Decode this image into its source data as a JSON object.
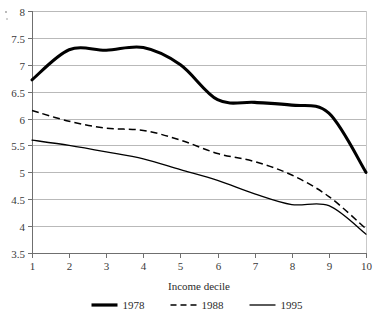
{
  "chart_data": {
    "type": "line",
    "title": "",
    "xlabel": "Income decile",
    "ylabel": "",
    "x": [
      1,
      2,
      3,
      4,
      5,
      6,
      7,
      8,
      9,
      10
    ],
    "categories": [
      "1",
      "2",
      "3",
      "4",
      "5",
      "6",
      "7",
      "8",
      "9",
      "10"
    ],
    "xlim": [
      1,
      10
    ],
    "ylim": [
      3.5,
      8
    ],
    "y_ticks": [
      3.5,
      4,
      4.5,
      5,
      5.5,
      6,
      6.5,
      7,
      7.5,
      8
    ],
    "y_tick_labels": [
      "3.5",
      "4",
      "4.5",
      "5",
      "5.5",
      "6",
      "6.5",
      "7",
      "7.5",
      "8"
    ],
    "x_ticks": [
      1,
      2,
      3,
      4,
      5,
      6,
      7,
      8,
      9,
      10
    ],
    "x_tick_labels": [
      "1",
      "2",
      "3",
      "4",
      "5",
      "6",
      "7",
      "8",
      "9",
      "10"
    ],
    "grid": "horizontal",
    "legend_position": "bottom",
    "series": [
      {
        "name": "1978",
        "style": "thick-solid",
        "color": "#000000",
        "values": [
          6.72,
          7.28,
          7.27,
          7.32,
          7.0,
          6.35,
          6.3,
          6.25,
          6.1,
          5.0
        ]
      },
      {
        "name": "1988",
        "style": "dashed",
        "color": "#000000",
        "values": [
          6.15,
          5.95,
          5.82,
          5.78,
          5.6,
          5.35,
          5.2,
          4.95,
          4.55,
          3.95
        ]
      },
      {
        "name": "1995",
        "style": "thin-solid",
        "color": "#000000",
        "values": [
          5.6,
          5.5,
          5.38,
          5.25,
          5.05,
          4.85,
          4.6,
          4.4,
          4.38,
          3.85
        ]
      }
    ]
  },
  "legend": {
    "items": [
      {
        "label": "1978"
      },
      {
        "label": "1988"
      },
      {
        "label": "1995"
      }
    ]
  },
  "axis": {
    "x_title": "Income decile"
  },
  "colors": {
    "line": "#000000",
    "grid": "#b9b9b9",
    "axis": "#6f6f6f",
    "text": "#2b2b2b",
    "background": "#ffffff"
  }
}
